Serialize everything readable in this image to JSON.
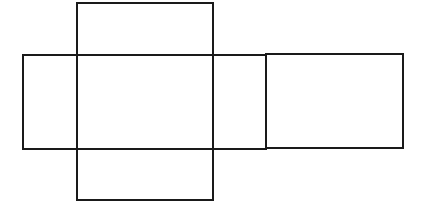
{
  "diagram": {
    "type": "net-of-rectangular-prism",
    "canvas": {
      "width": 422,
      "height": 214,
      "background": "#ffffff"
    },
    "stroke_color": "#1a1a1a",
    "faces": [
      {
        "name": "top-face",
        "x": 77,
        "y": 3,
        "width": 136,
        "height": 52
      },
      {
        "name": "left-face",
        "x": 23,
        "y": 55,
        "width": 54,
        "height": 94
      },
      {
        "name": "front-face",
        "x": 77,
        "y": 55,
        "width": 136,
        "height": 94
      },
      {
        "name": "right-face",
        "x": 213,
        "y": 55,
        "width": 53,
        "height": 94
      },
      {
        "name": "back-face",
        "x": 266,
        "y": 54,
        "width": 137,
        "height": 94
      },
      {
        "name": "bottom-face",
        "x": 77,
        "y": 149,
        "width": 136,
        "height": 51
      }
    ]
  }
}
